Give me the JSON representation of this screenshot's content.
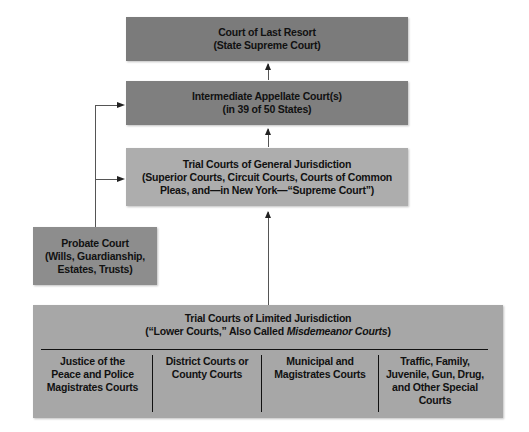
{
  "diagram": {
    "nodes": {
      "last_resort": {
        "line1": "Court of Last Resort",
        "line2": "(State Supreme Court)"
      },
      "appellate": {
        "line1": "Intermediate Appellate Court(s)",
        "line2": "(in 39 of 50 States)"
      },
      "general": {
        "line1": "Trial Courts of General Jurisdiction",
        "line2": "(Superior Courts, Circuit Courts, Courts of Common",
        "line3": "Pleas, and—in New York—“Supreme Court”)"
      },
      "probate": {
        "line1": "Probate Court",
        "line2": "(Wills, Guardianship,",
        "line3": "Estates, Trusts)"
      },
      "limited": {
        "line1": "Trial Courts of Limited Jurisdiction",
        "line2_prefix": "(“Lower Courts,” Also Called ",
        "line2_italic": "Misdemeanor Courts",
        "line2_suffix": ")",
        "columns": [
          {
            "lines": [
              "Justice of the",
              "Peace and Police",
              "Magistrates Courts"
            ]
          },
          {
            "lines": [
              "District Courts or",
              "County Courts"
            ]
          },
          {
            "lines": [
              "Municipal and",
              "Magistrates Courts"
            ]
          },
          {
            "lines": [
              "Traffic, Family,",
              "Juvenile, Gun, Drug,",
              "and Other Special",
              "Courts"
            ]
          }
        ]
      }
    },
    "edges": [
      {
        "from": "appellate",
        "to": "last_resort"
      },
      {
        "from": "general",
        "to": "appellate"
      },
      {
        "from": "limited",
        "to": "general"
      },
      {
        "from": "probate",
        "to": "appellate"
      },
      {
        "from": "probate",
        "to": "general"
      }
    ],
    "colors": {
      "last_resort": "#7b7b7b",
      "appellate": "#7f7f7f",
      "general": "#adadad",
      "probate": "#8d8d8d",
      "limited": "#a7a7a7",
      "text": "#111111",
      "connector": "#555555"
    }
  }
}
